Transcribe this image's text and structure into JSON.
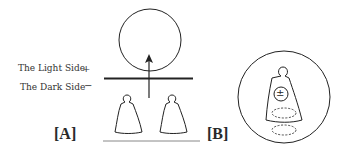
{
  "labels": {
    "light_side": "The Light Side",
    "dark_side": "The Dark Side",
    "plus": "+",
    "minus": "−",
    "panel_a": "[A]",
    "panel_b": "[B]",
    "plus_minus": "±"
  },
  "colors": {
    "stroke": "#222222",
    "baseline": "#888888"
  }
}
